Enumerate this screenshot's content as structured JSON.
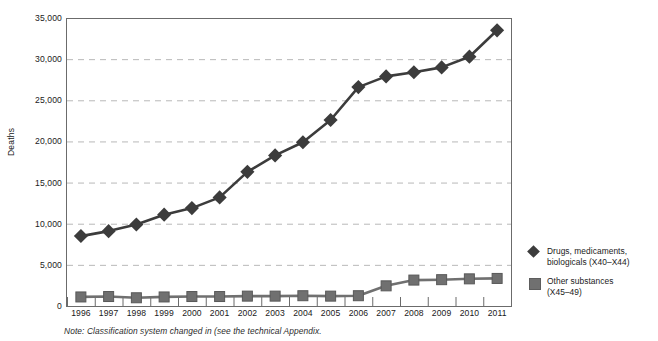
{
  "chart_data": {
    "type": "line",
    "title": "",
    "xlabel": "",
    "ylabel": "Deaths",
    "ylim": [
      0,
      35000
    ],
    "ytick_values": [
      0,
      5000,
      10000,
      15000,
      20000,
      25000,
      30000,
      35000
    ],
    "ytick_labels": [
      "0",
      "5,000",
      "10,000",
      "15,000",
      "20,000",
      "25,000",
      "30,000",
      "35,000"
    ],
    "grid": true,
    "grid_style": "dashed-horizontal",
    "legend_position": "right",
    "categories": [
      1996,
      1997,
      1998,
      1999,
      2000,
      2001,
      2002,
      2003,
      2004,
      2005,
      2006,
      2007,
      2008,
      2009,
      2010,
      2011
    ],
    "xtick_labels": [
      "1996",
      "1997",
      "1998",
      "1999",
      "2000",
      "2001",
      "2002",
      "2003",
      "2004",
      "2005",
      "2006",
      "2007",
      "2008",
      "2009",
      "2010",
      "2011"
    ],
    "series": [
      {
        "name": "Drugs, medicaments, biologicals (X40-X44)",
        "legend_line1": "Drugs, medicaments,",
        "legend_line2": "biologicals (X40–X44)",
        "marker": "diamond",
        "color": "#3c3c3c",
        "values": [
          8500,
          9100,
          9900,
          11100,
          11900,
          13200,
          16300,
          18300,
          19900,
          22600,
          26600,
          27900,
          28400,
          29000,
          30300,
          33500
        ]
      },
      {
        "name": "Other substances (X45-49)",
        "legend_line1": "Other substances",
        "legend_line2": "(X45–49)",
        "marker": "square",
        "color": "#707070",
        "values": [
          1100,
          1150,
          1000,
          1100,
          1150,
          1150,
          1200,
          1200,
          1250,
          1200,
          1250,
          2450,
          3150,
          3200,
          3300,
          3350
        ]
      }
    ],
    "note": "Note: Classification system changed in (see the technical Appendix."
  },
  "colors": {
    "series_drugs": "#3c3c3c",
    "series_other": "#707070",
    "gridline": "#b9b9b9",
    "axis": "#6b6b6b",
    "text": "#1a1a1a",
    "background": "#ffffff"
  }
}
